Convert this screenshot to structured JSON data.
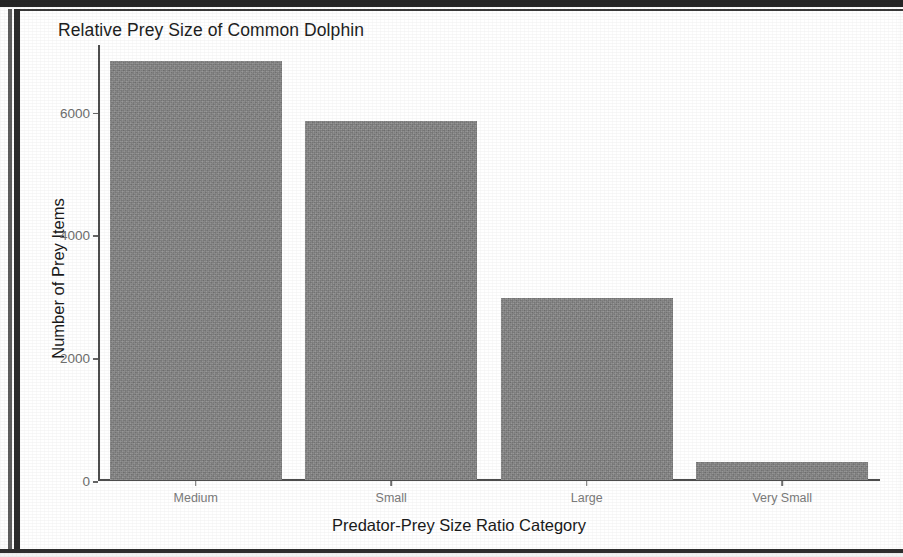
{
  "chart_data": {
    "type": "bar",
    "title": "Relative Prey Size of Common Dolphin",
    "xlabel": "Predator-Prey Size Ratio Category",
    "ylabel": "Number of Prey Items",
    "categories": [
      "Medium",
      "Small",
      "Large",
      "Very Small"
    ],
    "values": [
      6830,
      5850,
      2970,
      300
    ],
    "ytick_labels": [
      "0",
      "2000",
      "4000",
      "6000"
    ],
    "ytick_values": [
      0,
      2000,
      4000,
      6000
    ],
    "ylim": [
      0,
      7100
    ],
    "grid": false,
    "legend": null,
    "bar_color": "#838383",
    "axis_color": "#4d4d4d",
    "tick_label_color": "#6e6e6e",
    "title_color": "#1e1e1e"
  },
  "figure": {
    "background": "#ffffff",
    "frame_color": "#2b2b2b"
  }
}
